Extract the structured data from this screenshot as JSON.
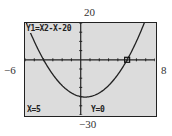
{
  "window": {
    "ymax_label": "20",
    "ymin_label": "−30",
    "xmin_label": "−6",
    "xmax_label": "8"
  },
  "screen": {
    "equation": "Y1=X2-X-20",
    "cursor_x": "X=5",
    "cursor_y": "Y=0"
  },
  "chart_data": {
    "type": "line",
    "function": "x^2 - x - 20",
    "xlim": [
      -6,
      8
    ],
    "ylim": [
      -30,
      20
    ],
    "xscale": 1,
    "yscale": 5,
    "trace_point": {
      "x": 5,
      "y": 0
    },
    "roots": [
      -4,
      5
    ],
    "vertex": {
      "x": 0.5,
      "y": -20.25
    },
    "grid": false,
    "background": "#dcdcdc",
    "curve_color": "#222222"
  }
}
